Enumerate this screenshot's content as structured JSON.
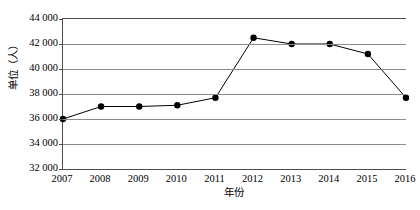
{
  "chart_data": {
    "type": "line",
    "title": "",
    "xlabel": "年份",
    "ylabel": "单位（人）",
    "categories": [
      "2007",
      "2008",
      "2009",
      "2010",
      "2011",
      "2012",
      "2013",
      "2014",
      "2015",
      "2016"
    ],
    "values": [
      36000,
      37000,
      37000,
      37100,
      37700,
      42500,
      42000,
      42000,
      41200,
      37700
    ],
    "series": [
      {
        "name": "",
        "values": [
          36000,
          37000,
          37000,
          37100,
          37700,
          42500,
          42000,
          42000,
          41200,
          37700
        ]
      }
    ],
    "ylim": [
      32000,
      44000
    ],
    "ytick_step": 2000,
    "ytick_labels": [
      "44 000",
      "42 000",
      "40 000",
      "38 000",
      "36 000",
      "34 000",
      "32 000"
    ],
    "ytick_values": [
      44000,
      42000,
      40000,
      38000,
      36000,
      34000,
      32000
    ],
    "xtick_labels": [
      "2007",
      "2008",
      "2009",
      "2010",
      "2011",
      "2012",
      "2013",
      "2014",
      "2015",
      "2016"
    ],
    "grid": true,
    "grid_axis": "y",
    "legend": false,
    "legend_position": "none",
    "marker": "filled-circle",
    "line_color": "#000000",
    "marker_color": "#000000",
    "grid_color": "#8c8c8c",
    "axis_color": "#4d4d4d",
    "background": "#ffffff"
  }
}
